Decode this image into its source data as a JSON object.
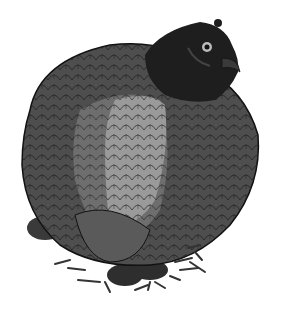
{
  "image": {
    "subject": "hen illustration",
    "background_color": "#ffffff",
    "colors": {
      "head": "#1e1e1e",
      "body_dark": "#4a4a4a",
      "body_mid": "#6e6e6e",
      "wing_light": "#9a9a9a",
      "feet": "#2e2e2e",
      "straw": "#333333",
      "outline": "#111111"
    }
  }
}
